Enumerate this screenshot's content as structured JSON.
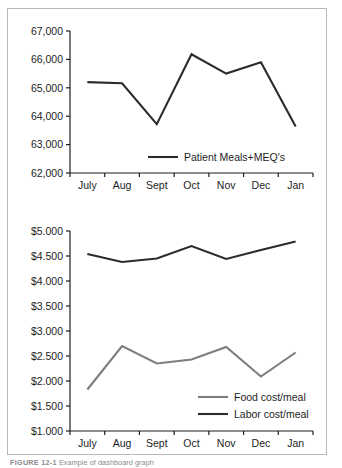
{
  "figure": {
    "caption_number": "FIGURE 12-1",
    "caption_text": "Example of dashboard graph",
    "border_color": "#b9b9b9",
    "background": "#ffffff"
  },
  "chart_data": [
    {
      "type": "line",
      "title": "",
      "xlabel": "",
      "ylabel": "",
      "categories": [
        "July",
        "Aug",
        "Sept",
        "Oct",
        "Nov",
        "Dec",
        "Jan"
      ],
      "ylim": [
        62000,
        67000
      ],
      "ytick_values": [
        62000,
        63000,
        64000,
        65000,
        66000,
        67000
      ],
      "ytick_labels": [
        "62,000",
        "63,000",
        "64,000",
        "65,000",
        "66,000",
        "67,000"
      ],
      "grid": false,
      "legend_position": "inside-bottom-right",
      "series": [
        {
          "name": "Patient Meals+MEQ's",
          "color": "#2b2b2b",
          "width": 2.1,
          "values": [
            65200,
            65160,
            63720,
            66180,
            65500,
            65900,
            63640
          ]
        }
      ]
    },
    {
      "type": "line",
      "title": "",
      "xlabel": "",
      "ylabel": "",
      "categories": [
        "July",
        "Aug",
        "Sept",
        "Oct",
        "Nov",
        "Dec",
        "Jan"
      ],
      "ylim": [
        1.0,
        5.0
      ],
      "ytick_values": [
        1.0,
        1.5,
        2.0,
        2.5,
        3.0,
        3.5,
        4.0,
        4.5,
        5.0
      ],
      "ytick_labels": [
        "$1.000",
        "$1.500",
        "$2.000",
        "$2.500",
        "$3.000",
        "$3.500",
        "$4.000",
        "$4.500",
        "$5.000"
      ],
      "grid": false,
      "legend_position": "inside-bottom-right",
      "series": [
        {
          "name": "Food cost/meal",
          "color": "#7d7d7d",
          "width": 2.1,
          "values": [
            1.83,
            2.7,
            2.35,
            2.43,
            2.68,
            2.09,
            2.57
          ]
        },
        {
          "name": "Labor cost/meal",
          "color": "#2b2b2b",
          "width": 2.1,
          "values": [
            4.54,
            4.38,
            4.45,
            4.7,
            4.44,
            4.62,
            4.79
          ]
        }
      ]
    }
  ]
}
